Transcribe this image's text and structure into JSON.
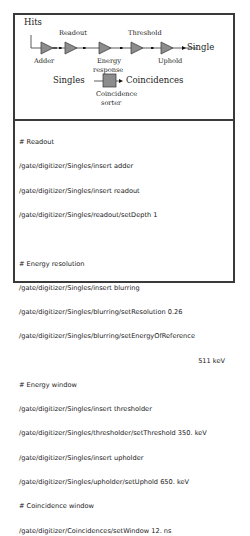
{
  "diagram": {
    "input_label": "Hits",
    "output_label": "Single",
    "modules": [
      {
        "name": "Adder",
        "position": "below"
      },
      {
        "name": "Readout",
        "position": "above"
      },
      {
        "name": "Energy response",
        "position": "below"
      },
      {
        "name": "Threshold",
        "position": "above"
      },
      {
        "name": "Uphold",
        "position": "below"
      }
    ],
    "module_labels": {
      "adder": "Adder",
      "readout": "Readout",
      "energy_line1": "Energy",
      "energy_line2": "response",
      "threshold": "Threshold",
      "uphold": "Uphold"
    },
    "sorter": {
      "input_label": "Singles",
      "output_label": "Coincidences",
      "name_line1": "Coincidence",
      "name_line2": "sorter"
    },
    "colors": {
      "module_fill": "#8c8c8c",
      "line": "#333333",
      "frame": "#3a3a3a"
    }
  },
  "code": {
    "lines": [
      "# Readout",
      "/gate/digitizer/Singles/insert adder",
      "/gate/digitizer/Singles/insert readout",
      "/gate/digitizer/Singles/readout/setDepth 1",
      "",
      "# Energy resolution",
      "/gate/digitizer/Singles/insert blurring",
      "/gate/digitizer/Singles/blurring/setResolution 0.26",
      "/gate/digitizer/Singles/blurring/setEnergyOfReference",
      "511 keV",
      "# Energy window",
      "/gate/digitizer/Singles/insert thresholder",
      "/gate/digitizer/Singles/thresholder/setThreshold 350. keV",
      "/gate/digitizer/Singles/insert upholder",
      "/gate/digitizer/Singles/upholder/setUphold 650. keV",
      "# Coincidence window",
      "/gate/digitizer/Coincidences/setWindow 12. ns"
    ]
  }
}
